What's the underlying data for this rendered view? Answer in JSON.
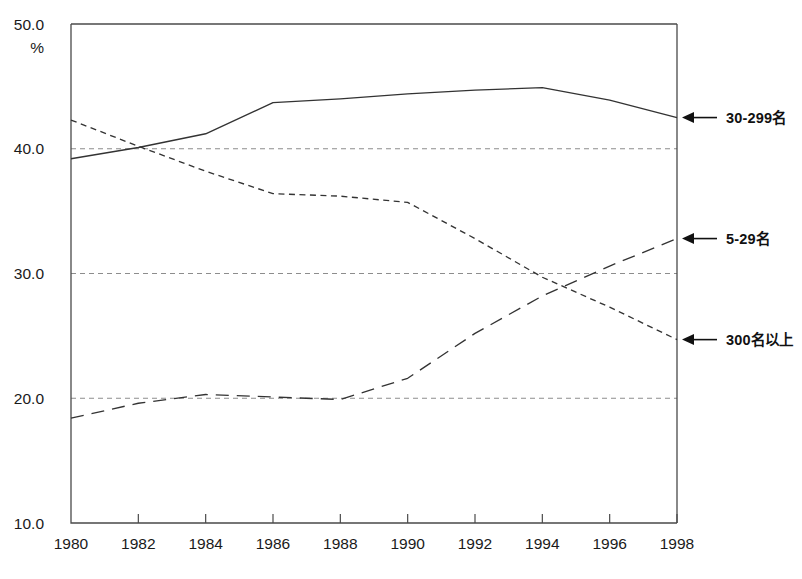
{
  "chart_data": {
    "type": "line",
    "title": "",
    "xlabel": "",
    "ylabel": "%",
    "unit_label": "%",
    "x": [
      1980,
      1982,
      1984,
      1986,
      1988,
      1990,
      1992,
      1994,
      1996,
      1998
    ],
    "xtick_labels": [
      "1980",
      "1982",
      "1984",
      "1986",
      "1988",
      "1990",
      "1992",
      "1994",
      "1996",
      "1998"
    ],
    "xlim": [
      1980,
      1998
    ],
    "ylim": [
      10.0,
      50.0
    ],
    "ytick_labels": [
      "50.0",
      "40.0",
      "30.0",
      "20.0",
      "10.0"
    ],
    "yticks": [
      50.0,
      40.0,
      30.0,
      20.0,
      10.0
    ],
    "grid": "horizontal-dashed-at-40-30-20",
    "gridlines": [
      40.0,
      30.0,
      20.0
    ],
    "legend_position": "right-inline-annotations",
    "series": [
      {
        "name": "30-299名",
        "style": "solid",
        "label": "30-299名",
        "label_value": 42.5,
        "values": [
          39.2,
          40.1,
          41.2,
          43.7,
          44.0,
          44.4,
          44.7,
          44.9,
          43.9,
          42.5
        ]
      },
      {
        "name": "5-29名",
        "style": "dashed",
        "label": "5-29名",
        "label_value": 32.8,
        "values": [
          18.4,
          19.6,
          20.3,
          20.1,
          19.9,
          21.6,
          25.2,
          28.2,
          30.6,
          32.8
        ]
      },
      {
        "name": "300名以上",
        "style": "dotted",
        "label": "300名以上",
        "label_value": 24.7,
        "values": [
          42.3,
          40.2,
          38.2,
          36.4,
          36.2,
          35.7,
          32.8,
          29.7,
          27.3,
          24.7
        ]
      }
    ],
    "annotations": [
      {
        "text": "30-299名",
        "at_year": 1998,
        "at_value": 42.5
      },
      {
        "text": "5-29名",
        "at_year": 1998,
        "at_value": 32.8
      },
      {
        "text": "300名以上",
        "at_year": 1998,
        "at_value": 24.7
      }
    ],
    "colors": {
      "line": "#333333",
      "axis": "#4a4a4a",
      "grid": "#8d8d8d",
      "text": "#1a1a1a",
      "background": "#ffffff"
    }
  }
}
